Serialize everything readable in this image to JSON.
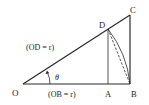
{
  "diagram": {
    "points": {
      "O": {
        "label": "O",
        "x": 23,
        "y": 84
      },
      "A": {
        "label": "A",
        "x": 108,
        "y": 84
      },
      "B": {
        "label": "B",
        "x": 130,
        "y": 84
      },
      "C": {
        "label": "C",
        "x": 130,
        "y": 15
      },
      "D": {
        "label": "D",
        "x": 108,
        "y": 29
      }
    },
    "labels": {
      "od": "(OD = r)",
      "ob": "(OB = r)",
      "theta": "θ"
    },
    "colors": {
      "line": "#2a2a2a",
      "text": "#222222"
    }
  }
}
